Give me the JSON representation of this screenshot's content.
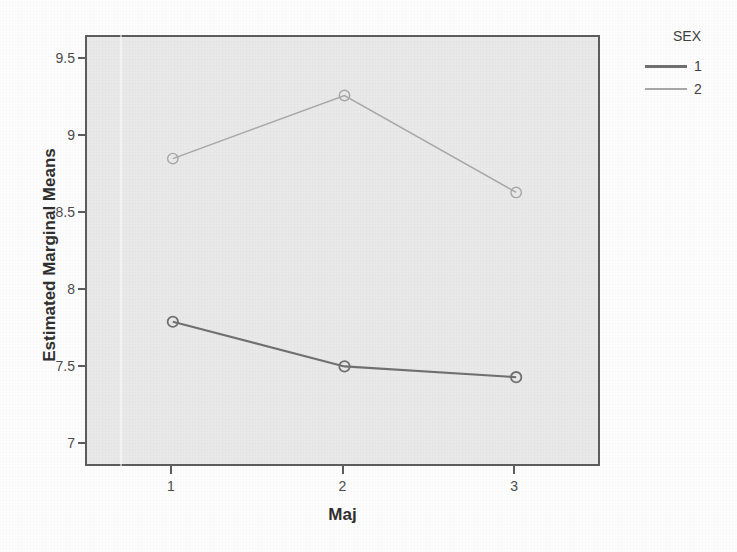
{
  "chart_data": {
    "type": "line",
    "title": "",
    "subtitle": "",
    "xlabel": "Maj",
    "ylabel": "Estimated Marginal Means",
    "categories": [
      "1",
      "2",
      "3"
    ],
    "x": [
      1,
      2,
      3
    ],
    "xtick_labels": [
      "1",
      "2",
      "3"
    ],
    "ytick_labels": [
      "9.5",
      "9",
      "8.5",
      "8",
      "7.5",
      "7"
    ],
    "ytick_values": [
      9.5,
      9,
      8.5,
      8,
      7.5,
      7
    ],
    "ylim": [
      6.85,
      9.65
    ],
    "xlim": [
      0.5,
      3.5
    ],
    "grid": false,
    "legend_position": "right",
    "legend_title": "SEX",
    "marker": "circle-open",
    "series": [
      {
        "name": "1",
        "color": "#707070",
        "values": [
          7.8,
          7.51,
          7.44
        ]
      },
      {
        "name": "2",
        "color": "#a8a8a8",
        "values": [
          8.86,
          9.27,
          8.64
        ]
      }
    ]
  },
  "axes": {
    "x_title": "Maj",
    "y_title": "Estimated Marginal Means"
  },
  "legend": {
    "title": "SEX",
    "items": [
      {
        "label": "1",
        "color": "#707070"
      },
      {
        "label": "2",
        "color": "#a8a8a8"
      }
    ]
  },
  "colors": {
    "plot_background": "#e9e9e9",
    "figure_background": "#fdfdfd",
    "frame": "#5d5d5d",
    "series_1": "#707070",
    "series_2": "#a8a8a8",
    "text": "#3f3f3f"
  }
}
